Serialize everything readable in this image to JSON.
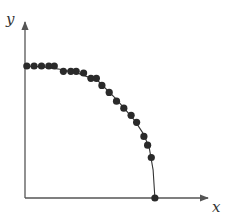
{
  "chart_data": {
    "type": "scatter",
    "title": "",
    "xlabel": "x",
    "ylabel": "y",
    "xlim": [
      0,
      1
    ],
    "ylim": [
      0,
      1
    ],
    "grid": false,
    "legend": "none",
    "colors": {
      "points": "#2a2a2a",
      "curve": "#333333",
      "axis": "#555555"
    },
    "series": [
      {
        "name": "points",
        "x": [
          0.01,
          0.05,
          0.09,
          0.13,
          0.16,
          0.21,
          0.25,
          0.28,
          0.32,
          0.36,
          0.39,
          0.42,
          0.46,
          0.5,
          0.54,
          0.58,
          0.61,
          0.65,
          0.67,
          0.69,
          0.71
        ],
        "y": [
          0.75,
          0.75,
          0.75,
          0.75,
          0.75,
          0.72,
          0.72,
          0.72,
          0.71,
          0.68,
          0.68,
          0.64,
          0.6,
          0.55,
          0.51,
          0.47,
          0.43,
          0.35,
          0.3,
          0.23,
          0.0
        ]
      },
      {
        "name": "curve",
        "x": [
          0.0,
          0.1,
          0.2,
          0.3,
          0.4,
          0.5,
          0.6,
          0.65,
          0.68,
          0.7,
          0.71
        ],
        "y": [
          0.75,
          0.745,
          0.73,
          0.705,
          0.665,
          0.56,
          0.44,
          0.36,
          0.28,
          0.16,
          0.0
        ]
      }
    ]
  }
}
